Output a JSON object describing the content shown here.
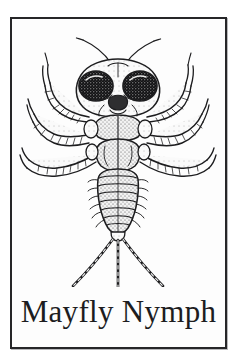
{
  "card": {
    "caption": "Mayfly Nymph",
    "frame_color": "#262628",
    "paper_color": "#fdfdfd",
    "ink_color": "#1d1d1f",
    "page_background": "#ffffff"
  },
  "illustration": {
    "subject": "mayfly-nymph",
    "view": "dorsal",
    "style": "black-and-white stippled line engraving",
    "parts": {
      "antennae": "antennae-pair",
      "eyes": "compound-eyes-pair",
      "head": "head-capsule",
      "mouthparts": "mouthparts",
      "thorax": "segmented-thorax",
      "legs": "three-leg-pairs",
      "abdomen": "segmented-abdomen",
      "gills": "lateral-gill-filaments",
      "tails": "three-caudal-filaments"
    },
    "counts": {
      "eyes": 2,
      "antennae": 2,
      "legs": 6,
      "abdomen_segments": 9,
      "tail_filaments": 3
    }
  }
}
